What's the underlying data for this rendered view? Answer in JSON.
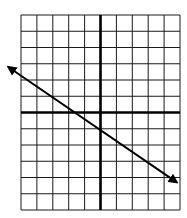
{
  "chart_data": {
    "type": "line",
    "title": "",
    "xlabel": "",
    "ylabel": "",
    "xlim": [
      -5,
      5
    ],
    "ylim": [
      -6,
      6
    ],
    "grid": true,
    "grid_step": 1,
    "axes_visible": true,
    "tick_labels": false,
    "series": [
      {
        "name": "line",
        "kind": "infinite-line-with-arrows",
        "slope": -0.6667,
        "y_intercept": -1,
        "x": [
          -5.8,
          4.8
        ],
        "y": [
          2.8,
          -4.3
        ],
        "color": "#000000"
      }
    ]
  },
  "colors": {
    "grid": "#1a1a1a",
    "axis": "#000000",
    "line": "#000000",
    "background": "#ffffff"
  }
}
